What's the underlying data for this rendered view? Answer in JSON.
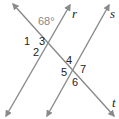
{
  "diagram": {
    "type": "parallel-lines-cut-by-transversal",
    "line_color": "#8a8a8a",
    "text_color": "#222222",
    "lines": [
      {
        "name": "r",
        "label": "r",
        "role": "parallel"
      },
      {
        "name": "s",
        "label": "s",
        "role": "parallel"
      },
      {
        "name": "t",
        "label": "t",
        "role": "transversal"
      }
    ],
    "given_angle": {
      "label": "68°",
      "value": 68,
      "unit": "degrees"
    },
    "angle_labels": [
      "1",
      "2",
      "3",
      "4",
      "5",
      "6",
      "7"
    ]
  }
}
